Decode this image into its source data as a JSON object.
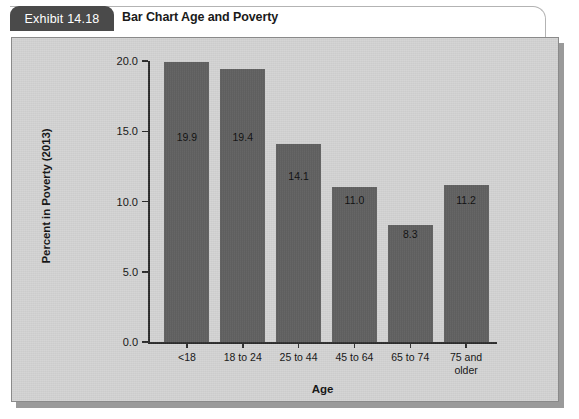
{
  "header": {
    "exhibit_label": "Exhibit 14.18",
    "exhibit_title": "Bar Chart Age and Poverty"
  },
  "colors": {
    "tab_background": "#4a4a4a",
    "tab_text": "#ffffff",
    "panel_background": "#d3d3d3",
    "bar_fill": "#5d5d5d",
    "axis": "#2b2b2b",
    "text": "#111111"
  },
  "chart_data": {
    "type": "bar",
    "title": "Bar Chart Age and Poverty",
    "xlabel": "Age",
    "ylabel": "Percent in Poverty (2013)",
    "categories": [
      "<18",
      "18 to 24",
      "25 to 44",
      "45 to 64",
      "65 to 74",
      "75 and\nolder"
    ],
    "values": [
      19.9,
      19.4,
      14.1,
      11.0,
      8.3,
      11.2
    ],
    "value_labels": [
      "19.9",
      "19.4",
      "14.1",
      "11.0",
      "8.3",
      "11.2"
    ],
    "ylim": [
      0.0,
      20.0
    ],
    "yticks": [
      0.0,
      5.0,
      10.0,
      15.0,
      20.0
    ],
    "ytick_labels": [
      "0.0",
      "5.0",
      "10.0",
      "15.0",
      "20.0"
    ],
    "grid": false,
    "legend": false
  }
}
